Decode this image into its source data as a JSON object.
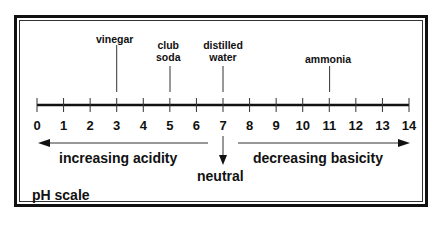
{
  "title": "pH scale",
  "scale": {
    "min": 0,
    "max": 14,
    "ticks": [
      "0",
      "1",
      "2",
      "3",
      "4",
      "5",
      "6",
      "7",
      "8",
      "9",
      "10",
      "11",
      "12",
      "13",
      "14"
    ]
  },
  "substances": [
    {
      "label": "vinegar",
      "ph": 3
    },
    {
      "label": "club soda",
      "line1": "club",
      "line2": "soda",
      "ph": 5
    },
    {
      "label": "distilled water",
      "line1": "distilled",
      "line2": "water",
      "ph": 7
    },
    {
      "label": "ammonia",
      "ph": 11
    }
  ],
  "arrows": {
    "left": "increasing acidity",
    "right": "decreasing basicity",
    "center": "neutral"
  }
}
